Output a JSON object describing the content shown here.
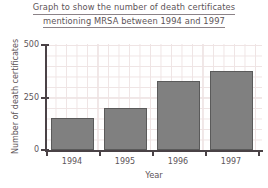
{
  "chart_data": {
    "type": "bar",
    "title": "Graph to show the number of death certificates mentioning MRSA between 1994 and 1997",
    "title_line1": "Graph to show the number of death certificates",
    "title_line2": "mentioning MRSA between 1994 and 1997",
    "categories": [
      "1994",
      "1995",
      "1996",
      "1997"
    ],
    "values": [
      150,
      200,
      325,
      375
    ],
    "xlabel": "Year",
    "ylabel": "Number of death certificates",
    "ylim": [
      0,
      500
    ],
    "ytick_labels": [
      "0",
      "250",
      "500"
    ],
    "ytick_values": [
      0,
      250,
      500
    ],
    "grid": true,
    "grid_minor_step": 50,
    "legend": null,
    "bar_color": "#808080",
    "bar_edge_color": "#5a5a5a",
    "grid_color": "#efe4e4",
    "axis_color": "#4a4246",
    "text_color": "#5d5458"
  }
}
